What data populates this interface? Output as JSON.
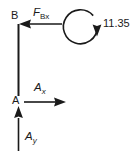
{
  "diagram": {
    "type": "free-body-diagram",
    "background_color": "#ffffff",
    "stroke_color": "#1a1a1a",
    "labels": {
      "point_b": "B",
      "point_a": "A",
      "force_bx_symbol": "F",
      "force_bx_subscript": "Bx",
      "reaction_ax_symbol": "A",
      "reaction_ax_subscript": "x",
      "reaction_ay_symbol": "A",
      "reaction_ay_subscript": "y",
      "moment_value": "11.35"
    },
    "members": [
      {
        "name": "member-ab",
        "from": "A",
        "to": "B",
        "orientation": "vertical"
      }
    ],
    "vectors": [
      {
        "name": "force-bx",
        "label": "F_Bx",
        "applied_at": "B",
        "direction": "left",
        "tail_x": 62,
        "head_x": 19,
        "y": 24
      },
      {
        "name": "reaction-ax",
        "label": "A_x",
        "applied_at": "A",
        "direction": "right",
        "tail_x": 24,
        "head_x": 66,
        "y": 102
      },
      {
        "name": "reaction-ay",
        "label": "A_y",
        "applied_at": "A",
        "direction": "up",
        "tail_y": 151,
        "head_y": 106,
        "x": 18
      }
    ],
    "moment": {
      "name": "applied-moment",
      "value": "11.35",
      "sense": "clockwise",
      "center_x": 82,
      "center_y": 27,
      "radius": 17
    }
  }
}
